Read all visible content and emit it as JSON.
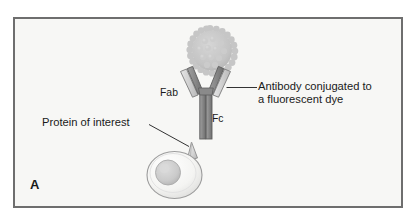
{
  "figure": {
    "panel_letter": "A",
    "background_color": "#f7f7f5",
    "border_color": "#6e6e6e"
  },
  "labels": {
    "antibody": "Antibody conjugated to\na fluorescent dye",
    "protein": "Protein of interest",
    "fab": "Fab",
    "fc": "Fc"
  },
  "diagram": {
    "elements": [
      {
        "name": "fluorescent-dye",
        "shape": "bumpy-circle",
        "color": "#c4c4c4",
        "center": [
          210,
          50
        ],
        "radius": 21
      },
      {
        "name": "antibody",
        "shape": "y-shaped-immunoglobulin",
        "light_chain_color": "#cfcfcf",
        "heavy_chain_color": "#8a8a8a",
        "outline_color": "#6a6a6a",
        "regions": [
          "Fab",
          "Fab",
          "Fc"
        ]
      },
      {
        "name": "cell",
        "shape": "oval",
        "fill_color": "#f2f2f0",
        "outline_color": "#9a9a9a",
        "center": [
          175,
          175
        ],
        "rx": 27,
        "ry": 23
      },
      {
        "name": "nucleus",
        "shape": "circle",
        "fill_color": "#cbcbcb",
        "center": [
          168,
          172
        ],
        "radius": 13
      },
      {
        "name": "surface-protein",
        "shape": "cone-spike",
        "fill_color": "#d8d8d8",
        "outline_color": "#8c8c8c",
        "tip": [
          192,
          142
        ]
      }
    ],
    "leader_lines": [
      {
        "name": "antibody-leader",
        "from": [
          227,
          88
        ],
        "to": [
          256,
          88
        ]
      },
      {
        "name": "protein-leader",
        "from": [
          148,
          124
        ],
        "to": [
          188,
          146
        ]
      }
    ]
  }
}
